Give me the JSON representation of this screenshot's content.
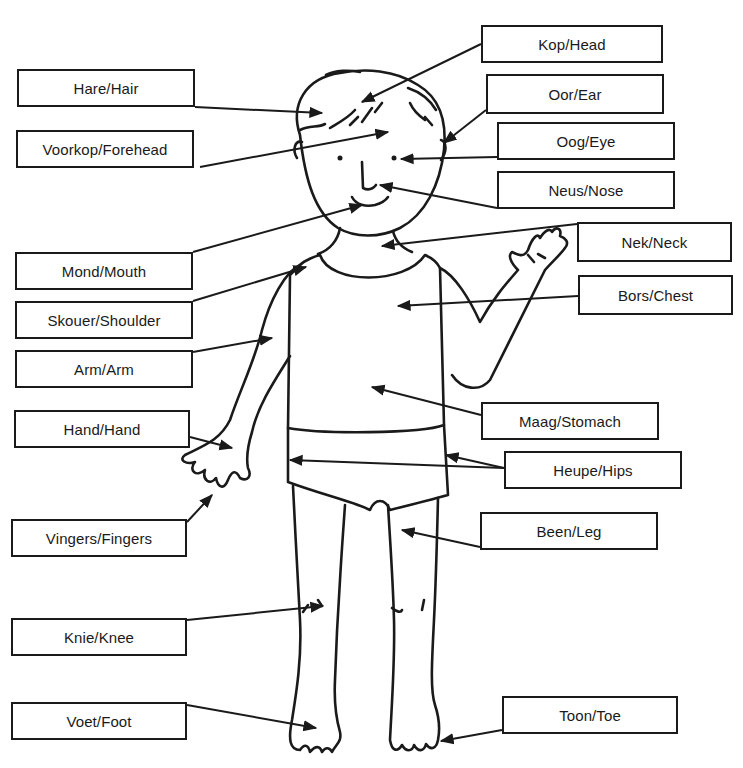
{
  "diagram": {
    "colors": {
      "ink": "#1a1a1a",
      "background": "#ffffff"
    },
    "labels": [
      {
        "id": "head",
        "text": "Kop/Head",
        "box": [
          481,
          25,
          182,
          38
        ],
        "line": [
          481,
          44,
          362,
          102
        ]
      },
      {
        "id": "hair",
        "text": "Hare/Hair",
        "box": [
          17,
          69,
          178,
          38
        ],
        "line": [
          195,
          107,
          322,
          113
        ]
      },
      {
        "id": "ear",
        "text": "Oor/Ear",
        "box": [
          486,
          74,
          178,
          40
        ],
        "line": [
          486,
          110,
          444,
          143
        ]
      },
      {
        "id": "forehead",
        "text": "Voorkop/Forehead",
        "box": [
          16,
          130,
          178,
          38
        ],
        "line": [
          200,
          167,
          388,
          132
        ]
      },
      {
        "id": "eye",
        "text": "Oog/Eye",
        "box": [
          497,
          122,
          178,
          38
        ],
        "line": [
          497,
          157,
          401,
          159
        ]
      },
      {
        "id": "nose",
        "text": "Neus/Nose",
        "box": [
          497,
          171,
          178,
          38
        ],
        "line": [
          497,
          208,
          380,
          185
        ]
      },
      {
        "id": "neck",
        "text": "Nek/Neck",
        "box": [
          577,
          222,
          155,
          40
        ],
        "line": [
          577,
          224,
          382,
          246
        ]
      },
      {
        "id": "mouth",
        "text": "Mond/Mouth",
        "box": [
          15,
          252,
          178,
          38
        ],
        "line": [
          193,
          252,
          362,
          205
        ]
      },
      {
        "id": "chest",
        "text": "Bors/Chest",
        "box": [
          578,
          275,
          155,
          40
        ],
        "line": [
          578,
          296,
          398,
          306
        ]
      },
      {
        "id": "shoulder",
        "text": "Skouer/Shoulder",
        "box": [
          15,
          301,
          178,
          38
        ],
        "line": [
          193,
          301,
          306,
          267
        ]
      },
      {
        "id": "arm",
        "text": "Arm/Arm",
        "box": [
          15,
          350,
          178,
          38
        ],
        "line": [
          193,
          352,
          272,
          338
        ]
      },
      {
        "id": "hand",
        "text": "Hand/Hand",
        "box": [
          14,
          410,
          176,
          38
        ],
        "line": [
          190,
          437,
          232,
          448
        ]
      },
      {
        "id": "stomach",
        "text": "Maag/Stomach",
        "box": [
          481,
          402,
          178,
          38
        ],
        "line": [
          481,
          415,
          372,
          387
        ]
      },
      {
        "id": "hips",
        "text": "Heupe/Hips",
        "box": [
          504,
          451,
          178,
          38
        ],
        "line": [
          504,
          468,
          290,
          460
        ],
        "line2": [
          504,
          468,
          446,
          455
        ]
      },
      {
        "id": "fingers",
        "text": "Vingers/Fingers",
        "box": [
          11,
          519,
          176,
          38
        ],
        "line": [
          187,
          522,
          212,
          495
        ]
      },
      {
        "id": "leg",
        "text": "Been/Leg",
        "box": [
          480,
          512,
          178,
          38
        ],
        "line": [
          480,
          547,
          402,
          530
        ]
      },
      {
        "id": "knee",
        "text": "Knie/Knee",
        "box": [
          11,
          618,
          176,
          38
        ],
        "line": [
          187,
          620,
          323,
          606
        ]
      },
      {
        "id": "foot",
        "text": "Voet/Foot",
        "box": [
          11,
          702,
          176,
          38
        ],
        "line": [
          187,
          705,
          316,
          728
        ]
      },
      {
        "id": "toe",
        "text": "Toon/Toe",
        "box": [
          502,
          696,
          176,
          38
        ],
        "line": [
          502,
          730,
          441,
          741
        ]
      }
    ]
  }
}
